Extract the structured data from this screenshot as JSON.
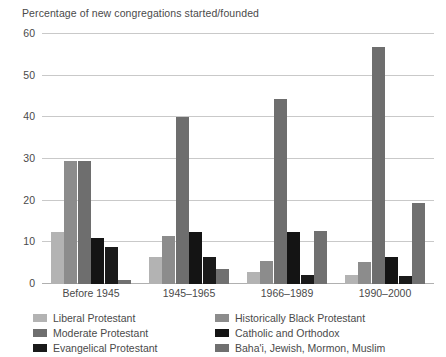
{
  "chart_data": {
    "type": "bar",
    "title": "Percentage of new congregations started/founded",
    "xlabel": "",
    "ylabel": "",
    "ylim": [
      0,
      60
    ],
    "yticks": [
      0,
      10,
      20,
      30,
      40,
      50,
      60
    ],
    "ytick_labels": [
      "0",
      "10",
      "20",
      "30",
      "40",
      "50",
      "60"
    ],
    "grid": true,
    "legend_position": "bottom",
    "categories": [
      "Before 1945",
      "1945–1965",
      "1966–1989",
      "1990–2000"
    ],
    "series": [
      {
        "name": "Liberal Protestant",
        "color": "#b3b3b3",
        "values": [
          12.5,
          6.5,
          3.0,
          2.2
        ]
      },
      {
        "name": "Historically Black Protestant",
        "color": "#8c8c8c",
        "values": [
          29.5,
          11.5,
          5.5,
          5.2
        ]
      },
      {
        "name": "Moderate Protestant",
        "color": "#6e6e6e",
        "values": [
          29.5,
          40.0,
          44.5,
          57.0
        ]
      },
      {
        "name": "Catholic and Orthodox",
        "color": "#141414",
        "values": [
          11.0,
          12.5,
          12.5,
          6.5
        ]
      },
      {
        "name": "Evangelical Protestant",
        "color": "#1a1a1a",
        "values": [
          9.0,
          6.5,
          2.2,
          2.0
        ]
      },
      {
        "name": "Baha'i, Jewish, Mormon, Muslim",
        "color": "#707070",
        "values": [
          1.0,
          3.5,
          12.8,
          19.5
        ]
      }
    ]
  },
  "legend": {
    "items": [
      {
        "label": "Liberal Protestant",
        "color": "#b3b3b3"
      },
      {
        "label": "Historically Black Protestant",
        "color": "#8c8c8c"
      },
      {
        "label": "Moderate Protestant",
        "color": "#6e6e6e"
      },
      {
        "label": "Catholic and Orthodox",
        "color": "#141414"
      },
      {
        "label": "Evangelical Protestant",
        "color": "#1a1a1a"
      },
      {
        "label": "Baha'i, Jewish, Mormon, Muslim",
        "color": "#707070"
      }
    ]
  }
}
